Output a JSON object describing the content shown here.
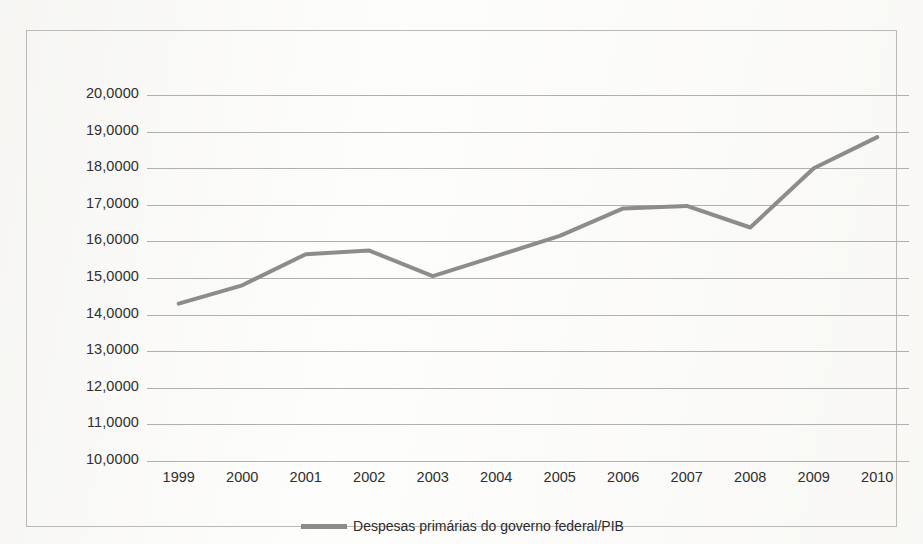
{
  "chart_data": {
    "type": "line",
    "title": "",
    "subtitle": "",
    "xlabel": "",
    "ylabel": "",
    "categories": [
      "1999",
      "2000",
      "2001",
      "2002",
      "2003",
      "2004",
      "2005",
      "2006",
      "2007",
      "2008",
      "2009",
      "2010"
    ],
    "series": [
      {
        "name": "Despesas primárias do governo federal/PIB",
        "color": "#8c8c8c",
        "values": [
          14.3,
          14.8,
          15.65,
          15.75,
          15.05,
          15.6,
          16.15,
          16.9,
          16.97,
          16.38,
          18.0,
          18.85
        ]
      }
    ],
    "ylim": [
      10.0,
      20.0
    ],
    "y_tick_step": 1.0,
    "y_tick_labels": [
      "20,0000",
      "19,0000",
      "18,0000",
      "17,0000",
      "16,0000",
      "15,0000",
      "14,0000",
      "13,0000",
      "12,0000",
      "11,0000",
      "10,0000"
    ],
    "y_tick_values": [
      20,
      19,
      18,
      17,
      16,
      15,
      14,
      13,
      12,
      11,
      10
    ],
    "x_tick_labels": [
      "1999",
      "2000",
      "2001",
      "2002",
      "2003",
      "2004",
      "2005",
      "2006",
      "2007",
      "2008",
      "2009",
      "2010"
    ],
    "grid": {
      "horizontal": true,
      "vertical": false,
      "color": "#b0b0ae"
    },
    "legend": {
      "position": "bottom-center",
      "entries": [
        {
          "label": "Despesas primárias do governo federal/PIB",
          "color": "#8c8c8c",
          "marker": "line-swatch"
        }
      ]
    },
    "style": {
      "line_width": 4,
      "markers": "none",
      "background": "#fdfdfc",
      "border_color": "#b9b9b7",
      "axis_text_color": "#2f2f2f"
    }
  },
  "legend": {
    "label": "Despesas primárias do governo federal/PIB"
  }
}
